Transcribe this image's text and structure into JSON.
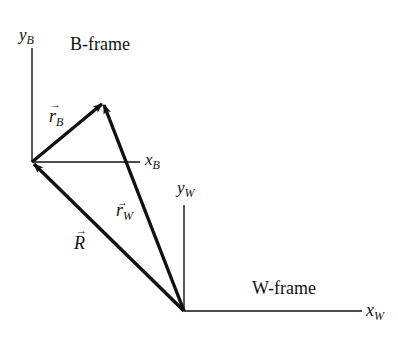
{
  "diagram": {
    "b_frame": {
      "title": "B-frame",
      "x_axis": {
        "symbol": "x",
        "subscript": "B"
      },
      "y_axis": {
        "symbol": "y",
        "subscript": "B"
      },
      "origin": [
        32,
        162
      ]
    },
    "w_frame": {
      "title": "W-frame",
      "x_axis": {
        "symbol": "x",
        "subscript": "W"
      },
      "y_axis": {
        "symbol": "y",
        "subscript": "W"
      },
      "origin": [
        184,
        311
      ]
    },
    "vectors": [
      {
        "name": "r_B",
        "symbol": "r",
        "subscript": "B",
        "from": "B origin",
        "to": "point P"
      },
      {
        "name": "r_W",
        "symbol": "r",
        "subscript": "W",
        "from": "W origin",
        "to": "point P"
      },
      {
        "name": "R",
        "symbol": "R",
        "subscript": "",
        "from": "W origin",
        "to": "B origin"
      }
    ],
    "arrow_mark": "→",
    "colors": {
      "ink": "#111111",
      "background": "#ffffff"
    }
  }
}
